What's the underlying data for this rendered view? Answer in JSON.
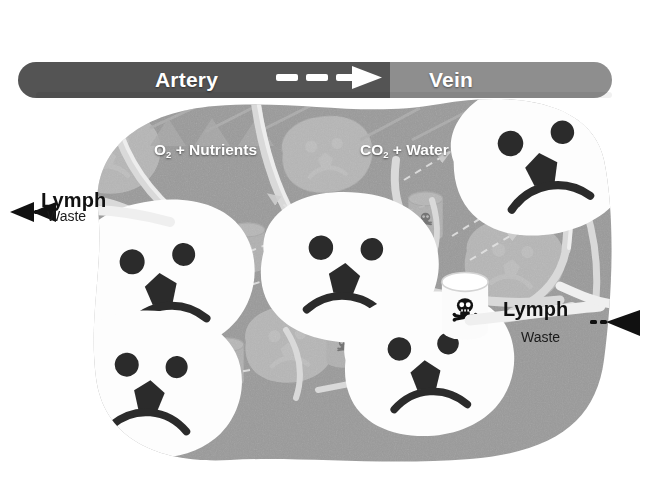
{
  "diagram": {
    "background_color": "#ffffff",
    "tissue_color": "#9a9a9a",
    "artery_color": "#555555",
    "vein_color": "#8e8e8e",
    "cell_color": "#fdfdfd",
    "ink_color": "#2b2b2b",
    "label_color": "#ffffff"
  },
  "vessel": {
    "artery_label": "Artery",
    "vein_label": "Vein",
    "flow_arrow": "dashed-right-arrow"
  },
  "exchange": {
    "supply_label_prefix": "O",
    "supply_label_sub": "2",
    "supply_label_suffix": " + Nutrients",
    "waste_label_prefix": "CO",
    "waste_label_sub": "2",
    "waste_label_suffix": " + Water"
  },
  "lymph_left": {
    "title": "Lymph",
    "subtitle": "Waste",
    "arrow_direction": "left"
  },
  "lymph_right": {
    "title": "Lymph",
    "subtitle": "Waste",
    "arrow_direction": "right"
  },
  "cells": [
    {
      "id": "cell-foreground-1",
      "x": 160,
      "y": 278,
      "scale": 1.0,
      "rot": -6,
      "layer": "foreground",
      "expression": "sad"
    },
    {
      "id": "cell-foreground-2",
      "x": 345,
      "y": 268,
      "scale": 0.98,
      "rot": 4,
      "layer": "foreground",
      "expression": "sad"
    },
    {
      "id": "cell-foreground-3",
      "x": 540,
      "y": 158,
      "scale": 1.02,
      "rot": -10,
      "layer": "foreground",
      "expression": "sad"
    },
    {
      "id": "cell-foreground-4",
      "x": 150,
      "y": 385,
      "scale": 0.96,
      "rot": 5,
      "layer": "foreground",
      "expression": "sad"
    },
    {
      "id": "cell-foreground-5",
      "x": 425,
      "y": 365,
      "scale": 0.94,
      "rot": -4,
      "layer": "foreground",
      "expression": "sad"
    },
    {
      "id": "cell-background-1",
      "x": 108,
      "y": 152,
      "scale": 0.55,
      "rot": 3,
      "layer": "background",
      "expression": "sad"
    },
    {
      "id": "cell-background-2",
      "x": 325,
      "y": 155,
      "scale": 0.5,
      "rot": -5,
      "layer": "background",
      "expression": "sad"
    },
    {
      "id": "cell-background-3",
      "x": 512,
      "y": 262,
      "scale": 0.55,
      "rot": 6,
      "layer": "background",
      "expression": "sad"
    },
    {
      "id": "cell-background-4",
      "x": 288,
      "y": 345,
      "scale": 0.5,
      "rot": -3,
      "layer": "background",
      "expression": "sad"
    },
    {
      "id": "cell-background-5",
      "x": 112,
      "y": 322,
      "scale": 0.5,
      "rot": 4,
      "layer": "background",
      "expression": "sad"
    }
  ],
  "toxin_barrels": [
    {
      "id": "barrel-foreground-1",
      "x": 465,
      "y": 305,
      "scale": 1.0,
      "layer": "foreground",
      "symbol": "skull-and-crossbones"
    },
    {
      "id": "barrel-background-1",
      "x": 246,
      "y": 247,
      "scale": 0.78,
      "layer": "background",
      "symbol": "skull-and-crossbones"
    },
    {
      "id": "barrel-background-2",
      "x": 424,
      "y": 216,
      "scale": 0.78,
      "layer": "background",
      "symbol": "skull-and-crossbones"
    },
    {
      "id": "barrel-background-3",
      "x": 342,
      "y": 342,
      "scale": 0.78,
      "layer": "background",
      "symbol": "skull-and-crossbones"
    },
    {
      "id": "barrel-background-4",
      "x": 225,
      "y": 362,
      "scale": 0.78,
      "layer": "background",
      "symbol": "skull-and-crossbones"
    }
  ],
  "capillaries": [
    "branch-upper-left",
    "branch-mid-left",
    "branch-center",
    "branch-upper-right",
    "branch-lower-right",
    "branch-lower-left"
  ],
  "diffusion_arrows": [
    "arrow-to-cell-1",
    "arrow-to-cell-2",
    "arrow-to-cell-3",
    "arrow-from-cell-1",
    "arrow-from-cell-2",
    "arrow-from-cell-3"
  ],
  "icon_names": [
    "artery-vessel",
    "vein-vessel",
    "flow-arrow-icon",
    "sad-cell-icon",
    "toxin-barrel-icon",
    "skull-crossbones-icon",
    "lymph-arrow-left-icon",
    "lymph-arrow-right-icon",
    "diffusion-arrow-icon"
  ]
}
